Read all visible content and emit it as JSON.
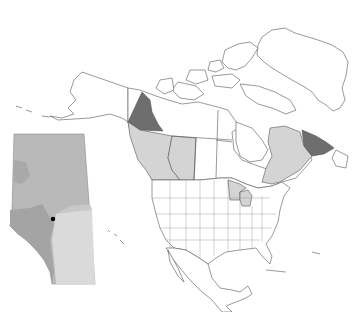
{
  "map": {
    "type": "species distribution map",
    "region": "North America",
    "inset": {
      "region": "Alberta",
      "location_marker": "black dot (single record)"
    },
    "shading": {
      "dark": {
        "color": "#6e6e6e",
        "regions": [
          "Yukon",
          "Labrador (north-east Quebec/Labrador)"
        ]
      },
      "light": {
        "color": "#d4d4d4",
        "regions": [
          "British Columbia",
          "Alberta",
          "Quebec",
          "Minnesota",
          "Wisconsin"
        ]
      },
      "none": {
        "color": "#ffffff",
        "regions": [
          "other states/provinces"
        ]
      }
    },
    "colors": {
      "outline": "#555555",
      "background": "#ffffff",
      "inset_base": "#b9b9b9",
      "inset_mid": "#a5a5a5",
      "inset_light": "#d8d8d8",
      "marker": "#000000"
    }
  }
}
